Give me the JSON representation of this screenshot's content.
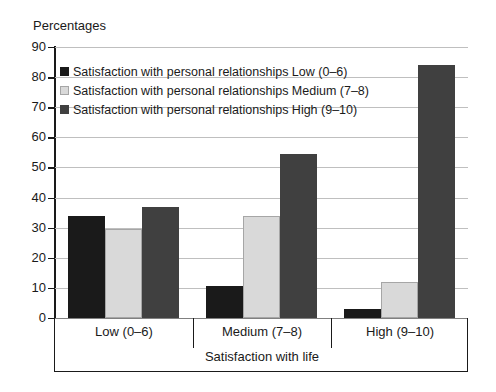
{
  "chart_data": {
    "type": "bar",
    "title": "Percentages",
    "xlabel": "Satisfaction with life",
    "ylabel": "",
    "ylim": [
      0,
      90
    ],
    "ytick_step": 10,
    "yticks": [
      90,
      80,
      70,
      60,
      50,
      40,
      30,
      20,
      10,
      0
    ],
    "grid": true,
    "legend_position": "inside-top-left",
    "categories": [
      "Low (0–6)",
      "Medium (7–8)",
      "High (9–10)"
    ],
    "series": [
      {
        "name": "Satisfaction with personal relationships Low  (0–6)",
        "color": "#1a1a1a",
        "values": [
          34,
          10.5,
          3
        ]
      },
      {
        "name": "Satisfaction with personal relationships Medium  (7–8)",
        "color": "#d9d9d9",
        "values": [
          29.5,
          34,
          11.8
        ]
      },
      {
        "name": "Satisfaction with personal relationships High  (9–10)",
        "color": "#404040",
        "values": [
          37,
          54.5,
          84
        ]
      }
    ]
  },
  "colors": {
    "series_low": "#1a1a1a",
    "series_medium": "#d9d9d9",
    "series_high": "#404040",
    "gridline": "#bfbfbf",
    "axis": "#1a1a1a",
    "background": "#ffffff"
  }
}
